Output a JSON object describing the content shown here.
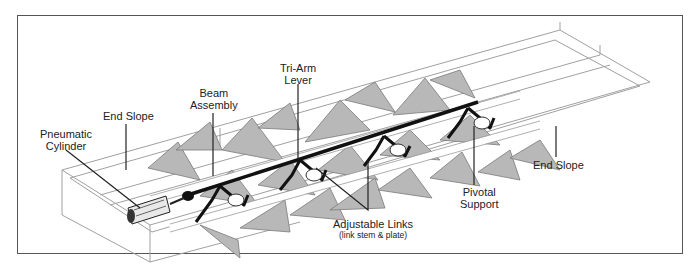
{
  "diagram": {
    "type": "isometric-mechanism-illustration",
    "colors": {
      "frame": "#555555",
      "background": "#ffffff",
      "louver_fill": "#b8b8b8",
      "louver_edge": "#7a7a7a",
      "rail": "#9a9a9a",
      "beam": "#111111",
      "leader": "#222222"
    },
    "labels": [
      {
        "id": "pneumatic-cylinder",
        "lines": [
          "Pneumatic",
          "Cylinder"
        ],
        "x": 40,
        "y": 128
      },
      {
        "id": "end-slope-left",
        "lines": [
          "End Slope"
        ],
        "x": 103,
        "y": 110
      },
      {
        "id": "beam-assembly",
        "lines": [
          "Beam",
          "Assembly"
        ],
        "x": 190,
        "y": 87
      },
      {
        "id": "tri-arm-lever",
        "lines": [
          "Tri-Arm",
          "Lever"
        ],
        "x": 280,
        "y": 62
      },
      {
        "id": "adjustable-links",
        "lines": [
          "Adjustable Links"
        ],
        "sub": "(link stem & plate)",
        "x": 333,
        "y": 218
      },
      {
        "id": "pivotal-support",
        "lines": [
          "Pivotal",
          "Support"
        ],
        "x": 460,
        "y": 186
      },
      {
        "id": "end-slope-right",
        "lines": [
          "End Slope"
        ],
        "x": 533,
        "y": 159
      }
    ],
    "leaders": [
      {
        "for": "pneumatic-cylinder",
        "points": [
          [
            66,
            150
          ],
          [
            140,
            208
          ]
        ]
      },
      {
        "for": "end-slope-left",
        "points": [
          [
            126,
            124
          ],
          [
            126,
            170
          ]
        ]
      },
      {
        "for": "beam-assembly",
        "points": [
          [
            213,
            113
          ],
          [
            213,
            176
          ]
        ]
      },
      {
        "for": "tri-arm-lever",
        "points": [
          [
            298,
            84
          ],
          [
            298,
            160
          ]
        ]
      },
      {
        "for": "adjustable-links",
        "points": [
          [
            316,
            168
          ],
          [
            368,
            210
          ],
          [
            368,
            160
          ]
        ]
      },
      {
        "for": "pivotal-support",
        "points": [
          [
            474,
            185
          ],
          [
            474,
            126
          ]
        ]
      },
      {
        "for": "end-slope-right",
        "points": [
          [
            556,
            157
          ],
          [
            556,
            126
          ]
        ]
      }
    ],
    "components": {
      "cylinder": {
        "x": 128,
        "y": 198
      },
      "tri_arm_levers": 4,
      "louver_rows": 2
    }
  }
}
